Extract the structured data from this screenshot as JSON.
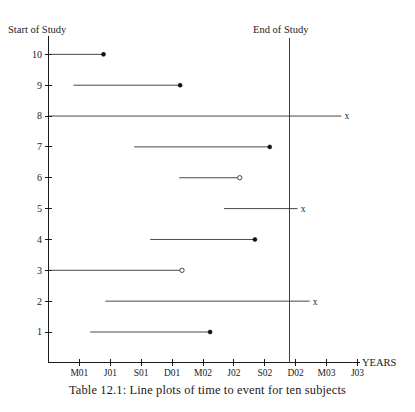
{
  "figure": {
    "caption": "Table 12.1: Line plots of time to event for ten subjects",
    "start_label": "Start of Study",
    "end_label": "End of Study",
    "x_axis_name": "YEARS"
  },
  "chart_data": {
    "type": "line",
    "title": "Line plots of time to event for ten subjects",
    "xlabel": "YEARS",
    "ylabel": "",
    "grid": false,
    "legend": "none",
    "annotations": [
      "Start of Study",
      "End of Study"
    ],
    "end_of_study_x": "D02",
    "x_tick_labels": [
      "M01",
      "J01",
      "S01",
      "D01",
      "M02",
      "J02",
      "S02",
      "D02",
      "M03",
      "J03"
    ],
    "x_tick_values": [
      1,
      2,
      3,
      4,
      5,
      6,
      7,
      8,
      9,
      10
    ],
    "xlim": [
      0,
      11
    ],
    "y_tick_labels": [
      "1",
      "2",
      "3",
      "4",
      "5",
      "6",
      "7",
      "8",
      "9",
      "10"
    ],
    "ylim": [
      0,
      10.6
    ],
    "marker_legend": {
      "filled-circle": "event",
      "open-circle": "lost to follow-up",
      "x": "censored at end of study"
    },
    "subjects": [
      {
        "id": 10,
        "start": 0.0,
        "end": 1.78,
        "end_marker": "filled-circle"
      },
      {
        "id": 9,
        "start": 0.81,
        "end": 4.26,
        "end_marker": "filled-circle"
      },
      {
        "id": 8,
        "start": 0.0,
        "end": 9.48,
        "end_marker": "x"
      },
      {
        "id": 7,
        "start": 2.77,
        "end": 7.16,
        "end_marker": "filled-circle"
      },
      {
        "id": 6,
        "start": 4.23,
        "end": 6.19,
        "end_marker": "open-circle"
      },
      {
        "id": 5,
        "start": 5.68,
        "end": 8.06,
        "end_marker": "x"
      },
      {
        "id": 4,
        "start": 3.29,
        "end": 6.68,
        "end_marker": "filled-circle"
      },
      {
        "id": 3,
        "start": 0.0,
        "end": 4.32,
        "end_marker": "open-circle"
      },
      {
        "id": 2,
        "start": 1.84,
        "end": 8.45,
        "end_marker": "x"
      },
      {
        "id": 1,
        "start": 1.35,
        "end": 5.23,
        "end_marker": "filled-circle"
      }
    ]
  }
}
